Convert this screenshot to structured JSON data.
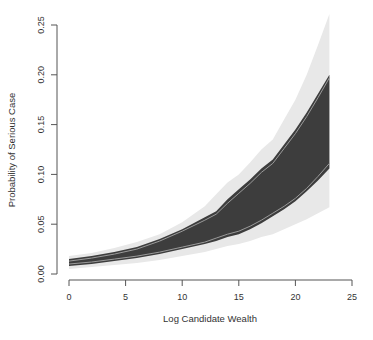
{
  "chart_data": {
    "type": "area",
    "title": "",
    "xlabel": "Log Candidate Wealth",
    "ylabel": "Probability of Serious Case",
    "xlim": [
      0,
      25
    ],
    "ylim": [
      0,
      0.25
    ],
    "xticks": [
      "0",
      "5",
      "10",
      "15",
      "20",
      "25"
    ],
    "yticks": [
      "0.00",
      "0.05",
      "0.10",
      "0.15",
      "0.20",
      "0.25"
    ],
    "grid": false,
    "legend": null,
    "x": [
      0,
      2,
      4,
      6,
      8,
      10,
      12,
      13,
      14,
      15,
      16,
      17,
      18,
      19,
      20,
      21,
      22,
      23
    ],
    "series": [
      {
        "name": "outer interval (light band)",
        "color": "#e8e8e8",
        "lower": [
          0.005,
          0.007,
          0.009,
          0.011,
          0.014,
          0.018,
          0.022,
          0.025,
          0.028,
          0.03,
          0.033,
          0.037,
          0.04,
          0.045,
          0.05,
          0.055,
          0.061,
          0.067
        ],
        "upper": [
          0.018,
          0.021,
          0.026,
          0.032,
          0.04,
          0.052,
          0.068,
          0.08,
          0.092,
          0.1,
          0.112,
          0.125,
          0.135,
          0.155,
          0.175,
          0.2,
          0.23,
          0.261
        ]
      },
      {
        "name": "inner interval (dark band)",
        "color": "#3d3d3d",
        "lower": [
          0.008,
          0.01,
          0.013,
          0.016,
          0.02,
          0.025,
          0.03,
          0.033,
          0.037,
          0.04,
          0.045,
          0.051,
          0.058,
          0.065,
          0.073,
          0.083,
          0.094,
          0.106
        ],
        "upper": [
          0.015,
          0.018,
          0.022,
          0.027,
          0.035,
          0.045,
          0.057,
          0.063,
          0.075,
          0.085,
          0.095,
          0.106,
          0.115,
          0.13,
          0.145,
          0.162,
          0.181,
          0.2
        ]
      },
      {
        "name": "inner boundary lines (light gray)",
        "color": "#9a9a9a",
        "lower": [
          0.01,
          0.012,
          0.015,
          0.018,
          0.022,
          0.027,
          0.032,
          0.036,
          0.04,
          0.043,
          0.048,
          0.054,
          0.061,
          0.068,
          0.076,
          0.086,
          0.098,
          0.111
        ],
        "upper": [
          0.013,
          0.016,
          0.02,
          0.025,
          0.033,
          0.043,
          0.054,
          0.06,
          0.071,
          0.081,
          0.091,
          0.102,
          0.111,
          0.126,
          0.141,
          0.158,
          0.177,
          0.197
        ]
      }
    ]
  }
}
